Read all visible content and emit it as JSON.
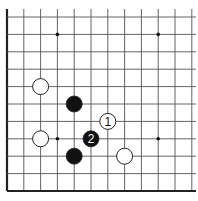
{
  "diagram": {
    "type": "go-board-fragment",
    "grid": {
      "columns_x": [
        7,
        23.8,
        40.6,
        57.4,
        74.2,
        91,
        107.8,
        124.6,
        141.4,
        158.2,
        175,
        191.8
      ],
      "rows_y": [
        17,
        34.4,
        51.8,
        69.2,
        86.6,
        104,
        121.4,
        138.8,
        156.2,
        173.6,
        191
      ],
      "top_extent_y": 9,
      "right_extent_x": 196,
      "left_edge": true,
      "bottom_edge": true,
      "line_color": "#555555",
      "edge_color": "#222222"
    },
    "star_points": [
      {
        "col": 3,
        "row": 1
      },
      {
        "col": 9,
        "row": 1
      },
      {
        "col": 3,
        "row": 7
      },
      {
        "col": 9,
        "row": 7
      }
    ],
    "stones": [
      {
        "color": "white",
        "col": 2,
        "row": 4,
        "label": ""
      },
      {
        "color": "black",
        "col": 4,
        "row": 5,
        "label": ""
      },
      {
        "color": "white",
        "col": 6,
        "row": 6,
        "label": "1"
      },
      {
        "color": "white",
        "col": 2,
        "row": 7,
        "label": ""
      },
      {
        "color": "black",
        "col": 5,
        "row": 7,
        "label": "2"
      },
      {
        "color": "black",
        "col": 4,
        "row": 8,
        "label": ""
      },
      {
        "color": "white",
        "col": 7,
        "row": 8,
        "label": ""
      }
    ],
    "stone_radius": 8
  }
}
